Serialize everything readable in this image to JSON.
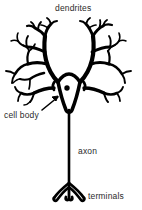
{
  "diagram": {
    "background_color": "#ffffff",
    "ink_color": "#000000",
    "label_color": "#2b2b2b",
    "width": 142,
    "height": 210,
    "labels": [
      {
        "id": "dendrites",
        "text": "dendrites",
        "x": 55,
        "y": 3
      },
      {
        "id": "cell_body",
        "text": "cell body",
        "x": 4,
        "y": 110
      },
      {
        "id": "axon",
        "text": "axon",
        "x": 78,
        "y": 146
      },
      {
        "id": "terminals",
        "text": "terminals",
        "x": 88,
        "y": 191
      }
    ],
    "parts": {
      "dendrites_label": "dendrites",
      "cell_body_label": "cell body",
      "axon_label": "axon",
      "terminals_label": "terminals",
      "nucleus": {
        "cx": 67,
        "cy": 88,
        "r": 2.6
      },
      "soma": {
        "cx": 68,
        "cy": 90
      },
      "axon_line": {
        "x": 70,
        "y_top": 112,
        "y_bottom": 184
      },
      "terminal_count": 3
    }
  }
}
